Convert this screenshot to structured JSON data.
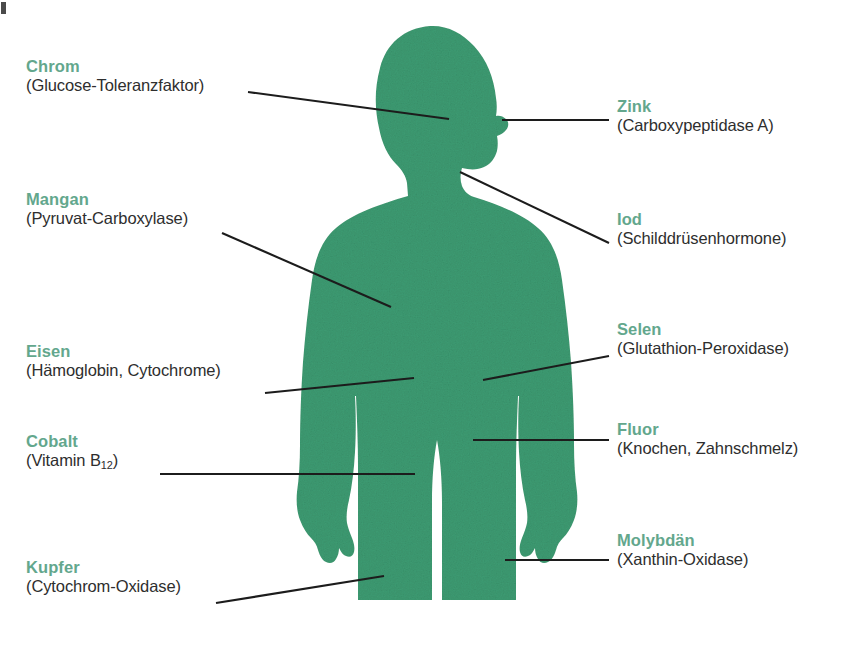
{
  "figure": {
    "kind": "anatomical-diagram",
    "silhouette": {
      "name": "human-body-silhouette",
      "orientation": "front view, head in right profile, cropped at mid-thigh",
      "fill_color": "#3d9b72",
      "texture": "mottled / stippled"
    },
    "leader_line_color": "#1c1c1c",
    "heading_color": "#63a78d",
    "subtitle_color": "#2e2e2e",
    "background_color": "#ffffff"
  },
  "labels_left": [
    {
      "id": "chrom",
      "element": "Chrom",
      "function": "(Glucose-Toleranzfaktor)",
      "x": 26,
      "y": 57,
      "line": {
        "x1": 248,
        "y1": 92,
        "x2": 449,
        "y2": 119
      }
    },
    {
      "id": "mangan",
      "element": "Mangan",
      "function": "(Pyruvat-Carboxylase)",
      "x": 26,
      "y": 190,
      "line": {
        "x1": 222,
        "y1": 233,
        "x2": 391,
        "y2": 307
      }
    },
    {
      "id": "eisen",
      "element": "Eisen",
      "function": "(Hämoglobin, Cytochrome)",
      "x": 26,
      "y": 342,
      "line": {
        "x1": 265,
        "y1": 393,
        "x2": 414,
        "y2": 378
      }
    },
    {
      "id": "cobalt",
      "element": "Cobalt",
      "function": "(Vitamin B<sub>12</sub>)",
      "function_plain": "(Vitamin B12)",
      "x": 26,
      "y": 432,
      "line": {
        "x1": 160,
        "y1": 474,
        "x2": 415,
        "y2": 474
      }
    },
    {
      "id": "kupfer",
      "element": "Kupfer",
      "function": "(Cytochrom-Oxidase)",
      "x": 26,
      "y": 558,
      "line": {
        "x1": 216,
        "y1": 603,
        "x2": 384,
        "y2": 576
      }
    }
  ],
  "labels_right": [
    {
      "id": "zink",
      "element": "Zink",
      "function": "(Carboxypeptidase A)",
      "x": 617,
      "y": 97,
      "line": {
        "x1": 502,
        "y1": 120,
        "x2": 609,
        "y2": 120
      }
    },
    {
      "id": "iod",
      "element": "Iod",
      "function": "(Schilddrüsenhormone)",
      "x": 617,
      "y": 210,
      "line": {
        "x1": 460,
        "y1": 172,
        "x2": 609,
        "y2": 243
      }
    },
    {
      "id": "selen",
      "element": "Selen",
      "function": "(Glutathion-Peroxidase)",
      "x": 617,
      "y": 320,
      "line": {
        "x1": 483,
        "y1": 380,
        "x2": 609,
        "y2": 356
      }
    },
    {
      "id": "fluor",
      "element": "Fluor",
      "function": "(Knochen, Zahnschmelz)",
      "x": 617,
      "y": 420,
      "line": {
        "x1": 473,
        "y1": 440,
        "x2": 609,
        "y2": 440
      }
    },
    {
      "id": "molybdaen",
      "element": "Molybdän",
      "function": "(Xanthin-Oxidase)",
      "x": 617,
      "y": 531,
      "line": {
        "x1": 505,
        "y1": 560,
        "x2": 609,
        "y2": 560
      }
    }
  ]
}
